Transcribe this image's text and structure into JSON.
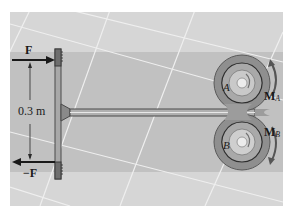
{
  "figure": {
    "colors": {
      "background_light": "#d6d6d6",
      "band_dark": "#b9b9b9",
      "grid_lines": "#eeeeee",
      "tool_outline": "#4a4a4a",
      "tool_fill": "#9a9a9a",
      "ring_fill": "#8c8c8c",
      "hub_fill": "#c8c8c8",
      "arrow": "#1a1a1a",
      "moment_arrow": "#555555"
    },
    "labels": {
      "force_top": "F",
      "force_bottom": "−F",
      "dimension": "0.3 m",
      "point_a": "A",
      "point_b": "B",
      "moment_a": "M",
      "moment_a_sub": "A",
      "moment_b": "M",
      "moment_b_sub": "B"
    },
    "icons": {
      "force_arrow_right": "arrow-right-icon",
      "force_arrow_left": "arrow-left-icon",
      "moment_a_arrow": "curved-arrow-up-icon",
      "moment_b_arrow": "curved-arrow-down-icon"
    }
  }
}
